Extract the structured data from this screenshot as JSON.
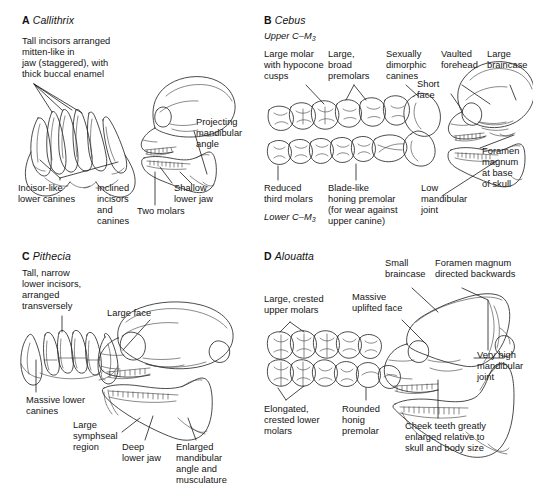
{
  "figure": {
    "background": "#ffffff",
    "ink": "#2a2a2a",
    "type": "scientific-line-art-figure"
  },
  "panels": [
    {
      "id": "a",
      "letter": "A",
      "genus": "Callithrix",
      "labels": [
        {
          "name": "tall-incisors",
          "text": "Tall incisors arranged\nmitten-like in\njaw (staggered), with\nthick buccal enamel"
        },
        {
          "name": "incisor-like-lower-canines",
          "text": "Incisor-like\nlower canines"
        },
        {
          "name": "inclined-incisors-and-canines",
          "text": "Inclined\nincisors\nand\ncanines"
        },
        {
          "name": "two-molars",
          "text": "Two molars"
        },
        {
          "name": "projecting-mandibular-angle",
          "text": "Projecting\nmandibular\nangle"
        },
        {
          "name": "shallow-lower-jaw",
          "text": "Shallow\nlower jaw"
        }
      ]
    },
    {
      "id": "b",
      "letter": "B",
      "genus": "Cebus",
      "row_labels": [
        {
          "name": "upper-tooth-row",
          "text": "Upper C–M",
          "sub": "3"
        },
        {
          "name": "lower-tooth-row",
          "text": "Lower C–M",
          "sub": "3"
        }
      ],
      "labels": [
        {
          "name": "large-molar-hypocone",
          "text": "Large molar\nwith hypocone\ncusps"
        },
        {
          "name": "large-broad-premolars",
          "text": "Large,\nbroad\npremolars"
        },
        {
          "name": "sexually-dimorphic-canines",
          "text": "Sexually\ndimorphic\ncanines"
        },
        {
          "name": "vaulted-forehead",
          "text": "Vaulted\nforehead"
        },
        {
          "name": "large-braincase",
          "text": "Large\nbraincase"
        },
        {
          "name": "short-face",
          "text": "Short\nface"
        },
        {
          "name": "foramen-magnum-base",
          "text": "Foramen\nmagnum\nat base\nof skull"
        },
        {
          "name": "reduced-third-molars",
          "text": "Reduced\nthird molars"
        },
        {
          "name": "blade-like-honing-premolar",
          "text": "Blade-like\nhoning premolar\n(for wear against\nupper canine)"
        },
        {
          "name": "low-mandibular-joint",
          "text": "Low\nmandibular\njoint"
        }
      ]
    },
    {
      "id": "c",
      "letter": "C",
      "genus": "Pithecia",
      "labels": [
        {
          "name": "tall-narrow-lower-incisors",
          "text": "Tall, narrow\nlower incisors,\narranged\ntransversely"
        },
        {
          "name": "massive-lower-canines",
          "text": "Massive lower\ncanines"
        },
        {
          "name": "large-face",
          "text": "Large face"
        },
        {
          "name": "large-symphseal-region",
          "text": "Large\nsymphseal\nregion"
        },
        {
          "name": "deep-lower-jaw",
          "text": "Deep\nlower jaw"
        },
        {
          "name": "enlarged-mandibular-angle",
          "text": "Enlarged\nmandibular\nangle and\nmusculature"
        }
      ]
    },
    {
      "id": "d",
      "letter": "D",
      "genus": "Alouatta",
      "labels": [
        {
          "name": "large-crested-upper-molars",
          "text": "Large, crested\nupper molars"
        },
        {
          "name": "massive-uplifted-face",
          "text": "Massive\nuplifted face"
        },
        {
          "name": "small-braincase",
          "text": "Small\nbraincase"
        },
        {
          "name": "foramen-magnum-backwards",
          "text": "Foramen magnum\ndirected backwards"
        },
        {
          "name": "very-high-mandibular-joint",
          "text": "Very high\nmandibular\njoint"
        },
        {
          "name": "elongated-crested-lower-molars",
          "text": "Elongated,\ncrested lower\nmolars"
        },
        {
          "name": "rounded-honing-premolar",
          "text": "Rounded\nhonig\npremolar"
        },
        {
          "name": "cheek-teeth-enlarged",
          "text": "Cheek teeth greatly\nenlarged relative to\nskull and body size"
        }
      ]
    }
  ]
}
